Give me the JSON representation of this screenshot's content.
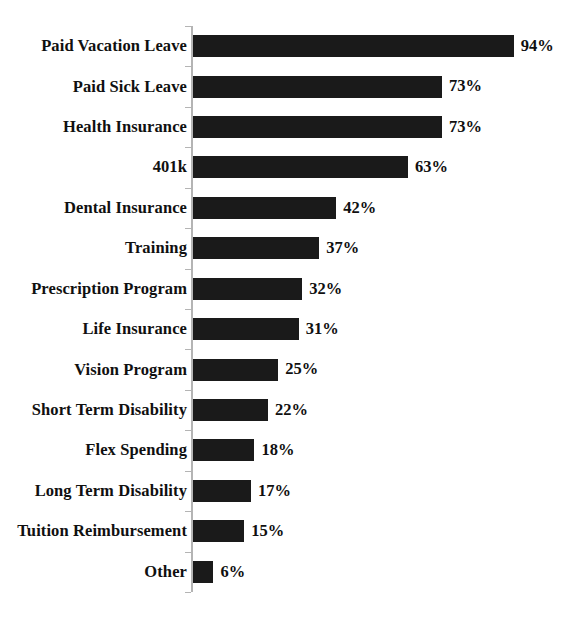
{
  "chart_data": {
    "type": "bar",
    "orientation": "horizontal",
    "title": "",
    "subtitle": "",
    "xlabel": "",
    "ylabel": "",
    "xlim": [
      0,
      100
    ],
    "grid": false,
    "legend": null,
    "value_suffix": "%",
    "categories": [
      "Paid Vacation Leave",
      "Paid Sick Leave",
      "Health Insurance",
      "401k",
      "Dental Insurance",
      "Training",
      "Prescription Program",
      "Life Insurance",
      "Vision Program",
      "Short Term Disability",
      "Flex Spending",
      "Long Term Disability",
      "Tuition Reimbursement",
      "Other"
    ],
    "values": [
      94,
      73,
      73,
      63,
      42,
      37,
      32,
      31,
      25,
      22,
      18,
      17,
      15,
      6
    ],
    "value_labels": [
      "94%",
      "73%",
      "73%",
      "63%",
      "42%",
      "37%",
      "32%",
      "31%",
      "25%",
      "22%",
      "18%",
      "17%",
      "15%",
      "6%"
    ],
    "colors": {
      "bar_fill": "#1a1a1a",
      "axis_line": "#b4b4b4",
      "text": "#101010",
      "background": "#ffffff"
    }
  }
}
